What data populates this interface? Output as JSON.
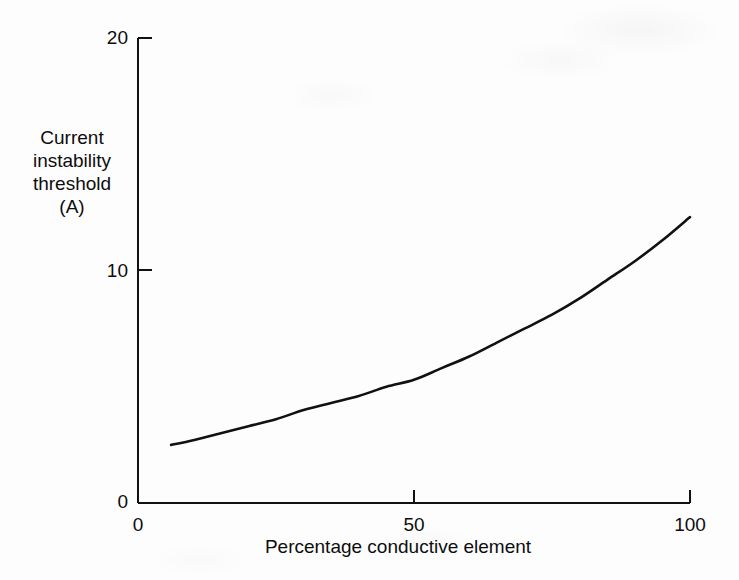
{
  "figure": {
    "background_color": "#fdfdfd",
    "ink_color": "#111111"
  },
  "axes": {
    "y_title_lines": [
      "Current",
      "instability",
      "threshold",
      "(A)"
    ],
    "y_ticks": [
      {
        "label": "20",
        "value": 20
      },
      {
        "label": "10",
        "value": 10
      },
      {
        "label": "0",
        "value": 0
      }
    ],
    "x_title": "Percentage conductive element",
    "x_ticks": [
      {
        "label": "0",
        "value": 0
      },
      {
        "label": "50",
        "value": 50
      },
      {
        "label": "100",
        "value": 100
      }
    ]
  },
  "chart_data": {
    "type": "line",
    "title": "",
    "subtitle": "",
    "xlabel": "Percentage conductive element",
    "ylabel": "Current instability threshold (A)",
    "xlim": [
      0,
      100
    ],
    "ylim": [
      0,
      20
    ],
    "xticks": [
      0,
      50,
      100
    ],
    "yticks": [
      0,
      10,
      20
    ],
    "grid": false,
    "legend": false,
    "legend_position": "none",
    "annotations": [],
    "series": [
      {
        "name": "Current instability threshold",
        "color": "#111111",
        "line_width": 2,
        "x": [
          6,
          10,
          15,
          20,
          25,
          30,
          35,
          40,
          45,
          50,
          55,
          60,
          65,
          70,
          75,
          80,
          85,
          90,
          95,
          100
        ],
        "y": [
          2.5,
          2.7,
          3.0,
          3.3,
          3.6,
          4.0,
          4.3,
          4.6,
          5.0,
          5.3,
          5.8,
          6.3,
          6.9,
          7.5,
          8.1,
          8.8,
          9.6,
          10.4,
          11.3,
          12.3
        ]
      }
    ]
  }
}
